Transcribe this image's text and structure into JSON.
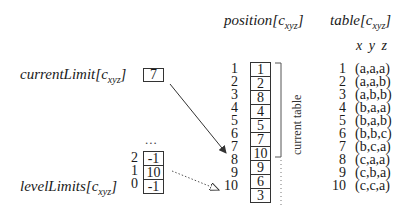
{
  "headers": {
    "position": {
      "name": "position",
      "arg": "c",
      "sub": "xyz"
    },
    "table": {
      "name": "table",
      "arg": "c",
      "sub": "xyz"
    },
    "table_columns": "x y z"
  },
  "current_limit": {
    "name": "currentLimit",
    "arg": "c",
    "sub": "xyz",
    "value": "7"
  },
  "level_limits": {
    "name": "levelLimits",
    "arg": "c",
    "sub": "xyz",
    "ellipsis": "...",
    "rows": [
      {
        "index": "2",
        "value": "-1"
      },
      {
        "index": "1",
        "value": "10"
      },
      {
        "index": "0",
        "value": "-1"
      }
    ]
  },
  "position_array": {
    "rows": [
      {
        "index": "1",
        "value": "1"
      },
      {
        "index": "2",
        "value": "2"
      },
      {
        "index": "3",
        "value": "8"
      },
      {
        "index": "4",
        "value": "4"
      },
      {
        "index": "5",
        "value": "5"
      },
      {
        "index": "6",
        "value": "7"
      },
      {
        "index": "7",
        "value": "10"
      },
      {
        "index": "8",
        "value": "9"
      },
      {
        "index": "9",
        "value": "6"
      },
      {
        "index": "10",
        "value": "3"
      }
    ],
    "bracket_label": "current table"
  },
  "table_array": {
    "rows": [
      {
        "index": "1",
        "tuple": "(a,a,a)"
      },
      {
        "index": "2",
        "tuple": "(a,a,b)"
      },
      {
        "index": "3",
        "tuple": "(a,b,b)"
      },
      {
        "index": "4",
        "tuple": "(b,a,a)"
      },
      {
        "index": "5",
        "tuple": "(b,a,b)"
      },
      {
        "index": "6",
        "tuple": "(b,b,c)"
      },
      {
        "index": "7",
        "tuple": "(b,c,a)"
      },
      {
        "index": "8",
        "tuple": "(c,a,a)"
      },
      {
        "index": "9",
        "tuple": "(c,b,a)"
      },
      {
        "index": "10",
        "tuple": "(c,c,a)"
      }
    ]
  },
  "colors": {
    "stroke": "#333333",
    "text": "#1a1a1a"
  }
}
